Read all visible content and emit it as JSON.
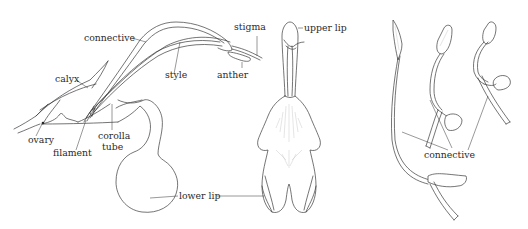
{
  "figure": {
    "panels": [
      {
        "id": "flower-side-section",
        "labels": {
          "connective": "connective",
          "calyx": "calyx",
          "style": "style",
          "stigma": "stigma",
          "anther": "anther",
          "ovary": "ovary",
          "filament": "filament",
          "corolla_tube_line1": "corolla",
          "corolla_tube_line2": "tube"
        }
      },
      {
        "id": "flower-front-view",
        "labels": {
          "upper_lip": "upper lip",
          "lower_lip": "lower lip"
        }
      },
      {
        "id": "stamen-lever-sequence",
        "labels": {
          "connective": "connective"
        }
      }
    ],
    "colors": {
      "background": "#ffffff",
      "line": "#3a3a3a",
      "label": "#2a2a2a"
    }
  }
}
